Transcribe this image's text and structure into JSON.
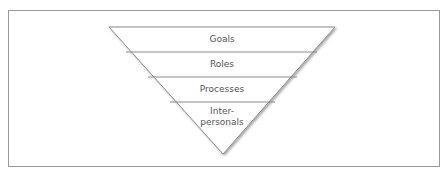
{
  "diagram": {
    "type": "inverted-pyramid",
    "layers": [
      {
        "label": "Goals"
      },
      {
        "label": "Roles"
      },
      {
        "label": "Processes"
      },
      {
        "label_line1": "Inter-",
        "label_line2": "personals"
      }
    ]
  }
}
